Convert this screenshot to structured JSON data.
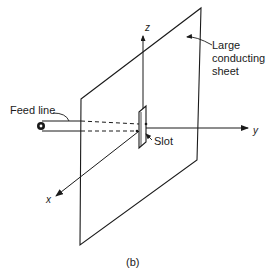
{
  "figure": {
    "caption": "(b)",
    "labels": {
      "feed_line": "Feed line",
      "slot": "Slot",
      "sheet_lines": [
        "Large",
        "conducting",
        "sheet"
      ]
    },
    "axes": {
      "x": "x",
      "y": "y",
      "z": "z"
    },
    "colors": {
      "ink": "#1a1a1a",
      "background": "#ffffff"
    }
  }
}
